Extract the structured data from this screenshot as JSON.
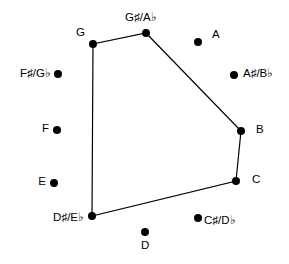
{
  "figure": {
    "background_color": "#ffffff",
    "stroke_color": "#000000",
    "dot_color": "#000000",
    "width": 289,
    "height": 264
  },
  "chart_data": {
    "type": "scatter",
    "title": "",
    "xlabel": "",
    "ylabel": "",
    "grid": false,
    "legend": null,
    "xlim": [
      0,
      289
    ],
    "ylim": [
      0,
      264
    ],
    "categories": [
      "C",
      "C#/Db",
      "D",
      "D#/Eb",
      "E",
      "F",
      "F#/Gb",
      "G",
      "G#/Ab",
      "A",
      "A#/Bb",
      "B"
    ],
    "points": [
      {
        "label": "G#/Ab",
        "label_text": "G♯/A♭",
        "x": 146,
        "y": 33,
        "in_set": true,
        "label_x": 125,
        "label_y": 12,
        "label_anchor": "left"
      },
      {
        "label": "A",
        "label_text": "A",
        "x": 198,
        "y": 42,
        "in_set": false,
        "label_x": 212,
        "label_y": 29,
        "label_anchor": "left"
      },
      {
        "label": "A#/Bb",
        "label_text": "A♯/B♭",
        "x": 234,
        "y": 75,
        "in_set": false,
        "label_x": 243,
        "label_y": 68,
        "label_anchor": "left"
      },
      {
        "label": "B",
        "label_text": "B",
        "x": 241,
        "y": 131,
        "in_set": true,
        "label_x": 256,
        "label_y": 124,
        "label_anchor": "left"
      },
      {
        "label": "C",
        "label_text": "C",
        "x": 236,
        "y": 181,
        "in_set": true,
        "label_x": 252,
        "label_y": 174,
        "label_anchor": "left"
      },
      {
        "label": "C#/Db",
        "label_text": "C♯/D♭",
        "x": 198,
        "y": 218,
        "in_set": false,
        "label_x": 204,
        "label_y": 215,
        "label_anchor": "left"
      },
      {
        "label": "D",
        "label_text": "D",
        "x": 145,
        "y": 232,
        "in_set": false,
        "label_x": 141,
        "label_y": 240,
        "label_anchor": "left"
      },
      {
        "label": "D#/Eb",
        "label_text": "D♯/E♭",
        "x": 92,
        "y": 216,
        "in_set": true,
        "label_x": 84,
        "label_y": 212,
        "label_anchor": "right"
      },
      {
        "label": "E",
        "label_text": "E",
        "x": 54,
        "y": 183,
        "in_set": false,
        "label_x": 46,
        "label_y": 176,
        "label_anchor": "right"
      },
      {
        "label": "F",
        "label_text": "F",
        "x": 57,
        "y": 130,
        "in_set": false,
        "label_x": 49,
        "label_y": 123,
        "label_anchor": "right"
      },
      {
        "label": "F#/Gb",
        "label_text": "F♯/G♭",
        "x": 58,
        "y": 74,
        "in_set": false,
        "label_x": 51,
        "label_y": 68,
        "label_anchor": "right"
      },
      {
        "label": "G",
        "label_text": "G",
        "x": 93,
        "y": 44,
        "in_set": true,
        "label_x": 85,
        "label_y": 27,
        "label_anchor": "right"
      }
    ],
    "polygon": {
      "closed": true,
      "vertices": [
        "G#/Ab",
        "B",
        "C",
        "D#/Eb",
        "G"
      ],
      "path": [
        [
          146,
          33
        ],
        [
          241,
          131
        ],
        [
          236,
          181
        ],
        [
          92,
          216
        ],
        [
          93,
          44
        ]
      ],
      "stroke_width": 1.2,
      "stroke": "#000000",
      "fill": "none"
    },
    "dot_radius": 4
  }
}
